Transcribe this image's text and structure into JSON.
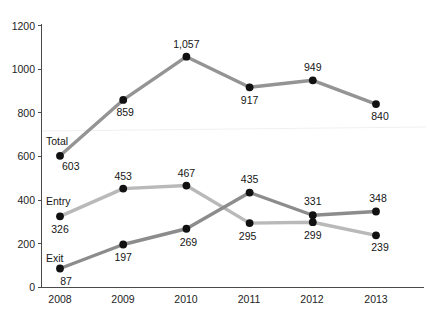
{
  "chart_data": {
    "type": "line",
    "title": "",
    "subtitle": "",
    "xlabel": "",
    "ylabel": "",
    "categories": [
      "2008",
      "2009",
      "2010",
      "2011",
      "2012",
      "2013"
    ],
    "ylim": [
      0,
      1200
    ],
    "yticks": [
      "0",
      "200",
      "400",
      "600",
      "800",
      "1000",
      "1200"
    ],
    "ytick_values": [
      0,
      200,
      400,
      600,
      800,
      1000,
      1200
    ],
    "grid": false,
    "legend_position": "inline-series-labels-at-first-point",
    "series": [
      {
        "name": "Total",
        "color": "#949494",
        "values": [
          603,
          859,
          1057,
          917,
          949,
          840
        ],
        "labels": [
          "603",
          "859",
          "1,057",
          "917",
          "949",
          "840"
        ]
      },
      {
        "name": "Entry",
        "color": "#b9b9b9",
        "values": [
          326,
          453,
          467,
          295,
          299,
          239
        ],
        "labels": [
          "326",
          "453",
          "467",
          "295",
          "299",
          "239"
        ]
      },
      {
        "name": "Exit",
        "color": "#8c8c8c",
        "values": [
          87,
          197,
          269,
          435,
          331,
          348
        ],
        "labels": [
          "87",
          "197",
          "269",
          "435",
          "331",
          "348"
        ]
      }
    ],
    "marker_color": "#111111",
    "axis_color": "#4a4a4a",
    "background": "#ffffff"
  },
  "axis": {
    "y_ticks": [
      "1200",
      "1000",
      "800",
      "600",
      "400",
      "200",
      "0"
    ],
    "x_ticks": [
      "2008",
      "2009",
      "2010",
      "2011",
      "2012",
      "2013"
    ]
  },
  "series_name_labels": {
    "total": "Total",
    "entry": "Entry",
    "exit": "Exit"
  },
  "value_labels": {
    "total": [
      "603",
      "859",
      "1,057",
      "917",
      "949",
      "840"
    ],
    "entry": [
      "326",
      "453",
      "467",
      "295",
      "299",
      "239"
    ],
    "exit": [
      "87",
      "197",
      "269",
      "435",
      "331",
      "348"
    ]
  }
}
